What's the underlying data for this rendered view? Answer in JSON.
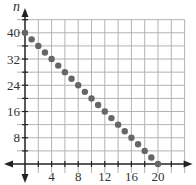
{
  "chart_data": {
    "type": "scatter",
    "title": "",
    "xlabel": "d",
    "ylabel": "n",
    "xlim": [
      -1.5,
      24
    ],
    "ylim": [
      -3,
      44
    ],
    "grid": true,
    "x_grid_step": 2,
    "y_grid_step": 4,
    "x_ticks": [
      4,
      8,
      12,
      16,
      20
    ],
    "y_ticks": [
      8,
      16,
      24,
      32,
      40
    ],
    "x_tick_labels": [
      "4",
      "8",
      "12",
      "16",
      "20"
    ],
    "y_tick_labels": [
      "8",
      "16",
      "24",
      "32",
      "40"
    ],
    "series": [
      {
        "name": "points",
        "color": "#666666",
        "x": [
          0,
          1,
          2,
          3,
          4,
          5,
          6,
          7,
          8,
          9,
          10,
          11,
          12,
          13,
          14,
          15,
          16,
          17,
          18,
          19,
          20
        ],
        "y": [
          40,
          38,
          36,
          34,
          32,
          30,
          28,
          26,
          24,
          22,
          20,
          18,
          16,
          14,
          12,
          10,
          8,
          6,
          4,
          2,
          0
        ]
      }
    ]
  },
  "colors": {
    "grid": "#b3b3b3",
    "axis": "#222222",
    "point": "#666666"
  }
}
